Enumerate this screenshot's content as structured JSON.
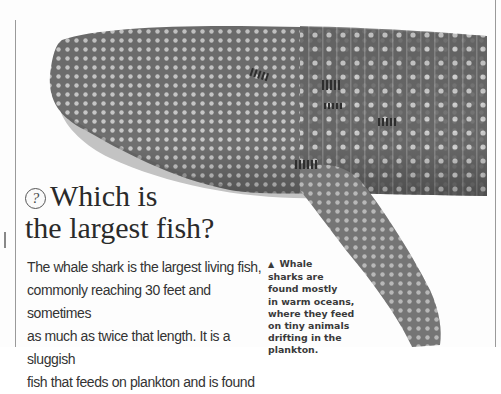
{
  "page": {
    "colors": {
      "background": "#fdfdfd",
      "rule": "#9a9a9a",
      "text": "#333333",
      "shark_body": "#6d6d6d",
      "shark_spots": "#d8d8d8"
    }
  },
  "illustration": {
    "subject": "whale shark",
    "icon": "whale-shark-illustration"
  },
  "article": {
    "question_icon": "?",
    "headline_line1": "Which is",
    "headline_line2": "the largest fish?",
    "body_lines": [
      "The whale shark is the largest living fish,",
      "commonly reaching 30 feet and sometimes",
      "as much as twice that length. It is a sluggish",
      "fish that feeds on plankton and is found"
    ]
  },
  "caption": {
    "pointer": "▲",
    "lines": [
      "Whale",
      "sharks are",
      "found mostly",
      "in warm oceans,",
      "where they feed",
      "on tiny animals",
      "drifting in the",
      "plankton."
    ]
  }
}
